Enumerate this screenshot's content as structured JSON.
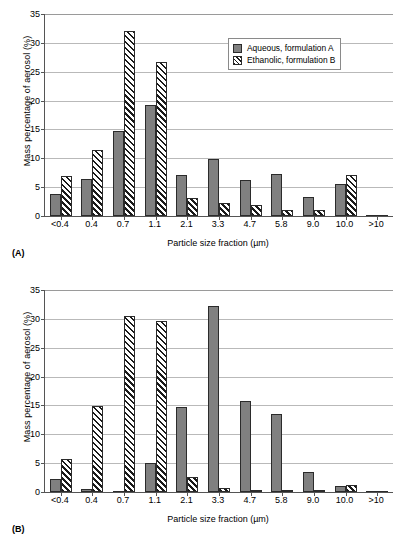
{
  "figure": {
    "panels": [
      {
        "tag": "(A)",
        "legend": [
          {
            "label": "Aqueous, formulation A",
            "style": "solid"
          },
          {
            "label": "Ethanolic, formulation B",
            "style": "hatch"
          }
        ]
      },
      {
        "tag": "(B)",
        "legend": [
          {
            "label": "Aqueous, formulation C",
            "style": "solid"
          },
          {
            "label": "Ethanolic, formulation D",
            "style": "hatch"
          }
        ]
      }
    ]
  },
  "chart_data": [
    {
      "type": "bar",
      "panel": "(A)",
      "title": "",
      "xlabel": "Particle size fraction (µm)",
      "ylabel": "Mass percentage of aerosol (%)",
      "ylim": [
        0,
        35
      ],
      "yticks": [
        0,
        5,
        10,
        15,
        20,
        25,
        30,
        35
      ],
      "grid": true,
      "legend_position": "top-right",
      "categories": [
        "<0.4",
        "0.4",
        "0.7",
        "1.1",
        "2.1",
        "3.3",
        "4.7",
        "5.8",
        "9.0",
        "10.0",
        ">10"
      ],
      "series": [
        {
          "name": "Aqueous, formulation A",
          "style": "solid",
          "values": [
            3.8,
            6.4,
            14.8,
            19.2,
            7.1,
            9.9,
            6.3,
            7.2,
            3.3,
            5.6,
            0
          ]
        },
        {
          "name": "Ethanolic, formulation B",
          "style": "hatch",
          "values": [
            7.0,
            11.4,
            32.1,
            26.6,
            3.1,
            2.2,
            1.9,
            1.1,
            1.1,
            7.1,
            0
          ]
        }
      ]
    },
    {
      "type": "bar",
      "panel": "(B)",
      "title": "",
      "xlabel": "Particle size fraction (µm)",
      "ylabel": "Mass percentage of aerosol (%)",
      "ylim": [
        0,
        35
      ],
      "yticks": [
        0,
        5,
        10,
        15,
        20,
        25,
        30,
        35
      ],
      "grid": true,
      "legend_position": "top-right",
      "categories": [
        "<0.4",
        "0.4",
        "0.7",
        "1.1",
        "2.1",
        "3.3",
        "4.7",
        "5.8",
        "9.0",
        "10.0",
        ">10"
      ],
      "series": [
        {
          "name": "Aqueous, formulation C",
          "style": "solid",
          "values": [
            2.3,
            0.6,
            0.2,
            5.0,
            14.7,
            32.2,
            15.7,
            13.5,
            3.4,
            1.1,
            0
          ]
        },
        {
          "name": "Ethanolic, formulation D",
          "style": "hatch",
          "values": [
            5.8,
            14.9,
            30.5,
            29.7,
            2.6,
            0.7,
            0.3,
            0.4,
            0.3,
            1.2,
            0
          ]
        }
      ]
    }
  ]
}
